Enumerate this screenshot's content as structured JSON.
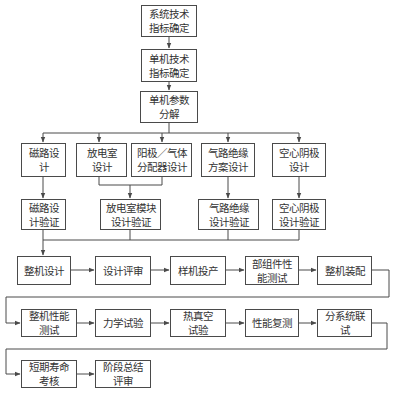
{
  "diagram": {
    "type": "flowchart",
    "colors": {
      "line": "#4a4a4a",
      "text": "#333333",
      "background": "#ffffff"
    },
    "nodes": {
      "sys_spec": "系统技术\n指标确定",
      "unit_spec": "单机技术\n指标确定",
      "param_decomp": "单机参数\n分解",
      "magnetic_design": "磁路设计",
      "chamber_design": "放电室\n设计",
      "anode_design": "阳极／气体\n分配器设计",
      "gas_insul_design": "气路绝缘\n方案设计",
      "cathode_design": "空心阴极\n设计",
      "magnetic_verify": "磁路设\n计验证",
      "chamber_verify": "放电室模块\n设计验证",
      "gas_insul_verify": "气路绝缘\n设计验证",
      "cathode_verify": "空心阴极\n设计验证",
      "whole_design": "整机设计",
      "design_review": "设计评审",
      "prototype": "样机投产",
      "component_test": "部组件性\n能测试",
      "assembly": "整机装配",
      "perf_test": "整机性能\n测试",
      "mech_test": "力学试验",
      "thermal_vac": "热真空\n试验",
      "perf_retest": "性能复测",
      "subsystem_test": "分系统联试",
      "life_test": "短期寿命\n考核",
      "stage_review": "阶段总结\n评审"
    }
  }
}
